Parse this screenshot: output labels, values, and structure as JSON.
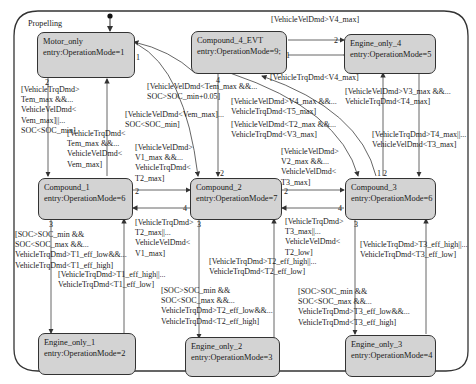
{
  "chart": {
    "superstate": {
      "name": "Propelling"
    },
    "states": [
      {
        "id": "motor_only",
        "name": "Motor_only",
        "entry": "entry:OperationMode=1"
      },
      {
        "id": "compound_4",
        "name": "Compound_4_EVT",
        "entry": "entry:OperationMode=9;"
      },
      {
        "id": "engine_only_4",
        "name": "Engine_only_4",
        "entry": "entry:OperationMode=5"
      },
      {
        "id": "compound_1",
        "name": "Compound_1",
        "entry": "entry:OperationMode=6"
      },
      {
        "id": "compound_2",
        "name": "Compound_2",
        "entry": "entry:OperationMode=7"
      },
      {
        "id": "compound_3",
        "name": "Compound_3",
        "entry": "entry:OperationMode=6"
      },
      {
        "id": "engine_only_1",
        "name": "Engine_only_1",
        "entry": "entry:OperationMode=2"
      },
      {
        "id": "engine_only_2",
        "name": "Engine_only_2",
        "entry": "entry:OperationMode=3"
      },
      {
        "id": "engine_only_3",
        "name": "Engine_only_3",
        "entry": "entry:OperationMode=4"
      }
    ],
    "transitions": [
      {
        "id": "c4_to_e4",
        "from": "Compound_4_EVT",
        "to": "Engine_only_4",
        "order": "1",
        "guard": "[VehicleTrqDmd<V4_max]"
      },
      {
        "id": "e4_to_c4",
        "from": "Engine_only_4",
        "to": "Compound_4_EVT",
        "order": "2",
        "guard": "[VehicleVelDmd>V4_max]"
      },
      {
        "id": "c4_to_motor",
        "from": "Compound_4_EVT",
        "to": "Motor_only",
        "order": "1",
        "guard": "[VehicleVelDmd<Tem_max &&...\nSOC>SOC_min+0.05]"
      },
      {
        "id": "c4_to_c2_order",
        "from": "Compound_4_EVT",
        "to": "Compound_2",
        "order": "4",
        "guard": ""
      },
      {
        "id": "motor_to_c1",
        "from": "Motor_only",
        "to": "Compound_1",
        "order": "2",
        "guard": "[VehicleTrqDmd>\nTem_max &&...\nVehicleVelDmd<\nVem_max]||...\nSOC<SOC_min]"
      },
      {
        "id": "c1_to_motor",
        "from": "Compound_1",
        "to": "Motor_only",
        "order": "1",
        "guard": "[VehicleTrqDmd<\nTem_max &&...\nVehicleVelDmd<\nVem_max]"
      },
      {
        "id": "motor_to_c2",
        "from": "Motor_only",
        "to": "Compound_2",
        "order": "",
        "guard": "[VehicleVelDmd<Vem_max]...\nSOC<SOC_min]"
      },
      {
        "id": "c3_to_c4",
        "from": "Compound_3",
        "to": "Compound_4_EVT",
        "order": "1",
        "guard": "[VehicleVelDmd>V4_max &&...\nVehicleTrqDmd<T5_max]"
      },
      {
        "id": "c4_to_c3",
        "from": "Compound_4_EVT",
        "to": "Compound_3",
        "order": "2",
        "guard": "[VehicleVelDmd<T2_max &&...\nVehicleTrqDmd<V3_max]"
      },
      {
        "id": "c3_to_e4",
        "from": "Compound_3",
        "to": "Engine_only_4",
        "order": "",
        "guard": "[VehicleVelDmd>V3_max &&...\nVehicleTrqDmd<T4_max]"
      },
      {
        "id": "e4_to_c3",
        "from": "Engine_only_4",
        "to": "Compound_3",
        "order": "",
        "guard": "[VehicleTrqDmd>T4_max||...\nVehicleVelDmd<T3_max]"
      },
      {
        "id": "c1_to_c2",
        "from": "Compound_1",
        "to": "Compound_2",
        "order": "2",
        "guard": "[VehicleVelDmd>\nV1_max &&...\nVehicleTrqDmd<\nT2_max]"
      },
      {
        "id": "c2_to_c1",
        "from": "Compound_2",
        "to": "Compound_1",
        "order": "4",
        "guard": "[VehicleTrqDmd>\nT2_max||...\nVehicleVelDmd<\nV1_max]"
      },
      {
        "id": "c2_to_c3",
        "from": "Compound_2",
        "to": "Compound_3",
        "order": "2",
        "guard": "[VehicleVelDmd>\nV2_max &&...\nVehicleVelDmd<\nT3_max]"
      },
      {
        "id": "c3_to_c2",
        "from": "Compound_3",
        "to": "Compound_2",
        "order": "4",
        "guard": "[VehicleTrqDmd>\nT3_max||...\nVehicleVelDmd<\nT2_low]"
      },
      {
        "id": "c1_to_e1",
        "from": "Compound_1",
        "to": "Engine_only_1",
        "order": "3",
        "guard": "[SOC>SOC_min &&\nSOC<SOC_max &&...\nVehicleTrqDmd>T1_eff_low&&...\nVehicleTrqDmd<T1_eff_high]"
      },
      {
        "id": "e1_to_c1",
        "from": "Engine_only_1",
        "to": "Compound_1",
        "order": "",
        "guard": "[VehicleTrqDmd>T1_eff_high||...\nVehicleTrqDmd<T1_eff_low]"
      },
      {
        "id": "c2_to_e2",
        "from": "Compound_2",
        "to": "Engine_only_2",
        "order": "3",
        "guard": "[SOC>SOC_min &&\nSOC<SOC_max &&...\nVehicleTrqDmd>T2_eff_low&&...\nVehicleTrqDmd<T2_eff_high]"
      },
      {
        "id": "e2_to_c2",
        "from": "Engine_only_2",
        "to": "Compound_2",
        "order": "",
        "guard": "[VehicleTrqDmd>T2_eff_high||...\nVehicleTrqDmd<T2_eff_low]"
      },
      {
        "id": "c3_to_e3",
        "from": "Compound_3",
        "to": "Engine_only_3",
        "order": "3",
        "guard": "[SOC>SOC_min &&\nSOC<SOC_max &&...\nVehicleTrqDmd>T3_eff_low&&...\nVehicleTrqDmd<T3_eff_high]"
      },
      {
        "id": "e3_to_c3",
        "from": "Engine_only_3",
        "to": "Compound_3",
        "order": "",
        "guard": "[VehicleTrqDmd>T3_eff_high||...\nVehicleTrqDmd<T3_eff_low]"
      }
    ],
    "extra_orders": {
      "c2_top": "2",
      "c3_top_1": "1",
      "c3_top_2": "2",
      "c2_bottom": "3",
      "c3_bottom": "3",
      "c4_bottom": "4"
    }
  },
  "colors": {
    "state_fill": "#d3d3d3",
    "stroke": "#333333",
    "background": "#ffffff"
  }
}
